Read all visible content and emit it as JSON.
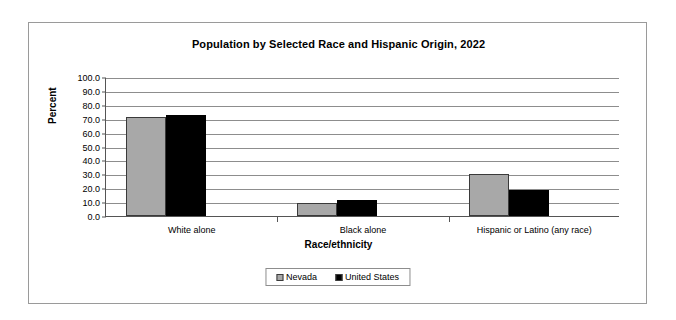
{
  "chart_data": {
    "type": "bar",
    "title": "Population by Selected Race and Hispanic Origin, 2022",
    "xlabel": "Race/ethnicity",
    "ylabel": "Percent",
    "categories": [
      "White alone",
      "Black alone",
      "Hispanic or Latino (any race)"
    ],
    "series": [
      {
        "name": "Nevada",
        "color": "#a8a8a8",
        "values": [
          71.0,
          9.5,
          30.0
        ]
      },
      {
        "name": "United States",
        "color": "#000000",
        "values": [
          73.0,
          11.5,
          19.0
        ]
      }
    ],
    "ylim": [
      0,
      100
    ],
    "ytick_labels": [
      "100.0",
      "90.0",
      "80.0",
      "70.0",
      "60.0",
      "50.0",
      "40.0",
      "30.0",
      "20.0",
      "10.0",
      "0.0"
    ],
    "ytick_values": [
      100,
      90,
      80,
      70,
      60,
      50,
      40,
      30,
      20,
      10,
      0
    ],
    "grid": true,
    "legend_position": "bottom"
  }
}
